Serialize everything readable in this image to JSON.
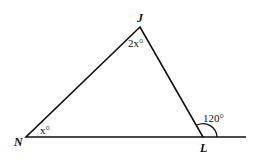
{
  "figure": {
    "type": "triangle",
    "vertices": {
      "J": {
        "label": "J",
        "angle_label": "2x°"
      },
      "N": {
        "label": "N",
        "angle_label": "x°"
      },
      "L": {
        "label": "L",
        "exterior_angle_label": "120°"
      }
    },
    "colors": {
      "stroke": "#111111",
      "background": "#ffffff"
    }
  }
}
